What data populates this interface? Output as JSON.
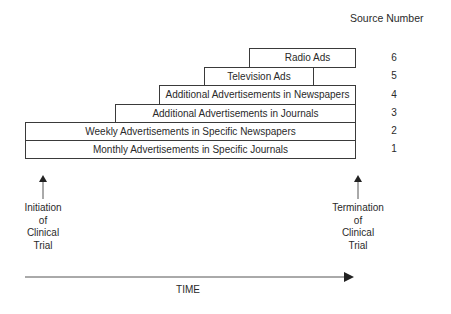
{
  "header": {
    "source_number_label": "Source Number"
  },
  "sources": [
    {
      "number": "1",
      "label": "Monthly Advertisements in Specific Journals",
      "left": 25,
      "right": 355,
      "top": 140
    },
    {
      "number": "2",
      "label": "Weekly Advertisements in Specific Newspapers",
      "left": 25,
      "right": 355,
      "top": 122
    },
    {
      "number": "3",
      "label": "Additional Advertisements in Journals",
      "left": 115,
      "right": 355,
      "top": 104
    },
    {
      "number": "4",
      "label": "Additional Advertisements in Newspapers",
      "left": 159,
      "right": 355,
      "top": 85
    },
    {
      "number": "5",
      "label": "Television Ads",
      "left": 204,
      "right": 313,
      "top": 67
    },
    {
      "number": "6",
      "label": "Radio Ads",
      "left": 249,
      "right": 356,
      "top": 48
    }
  ],
  "markers": {
    "start": {
      "line1": "Initiation",
      "line2": "of",
      "line3": "Clinical",
      "line4": "Trial"
    },
    "end": {
      "line1": "Termination",
      "line2": "of",
      "line3": "Clinical",
      "line4": "Trial"
    }
  },
  "axis": {
    "label": "TIME"
  }
}
